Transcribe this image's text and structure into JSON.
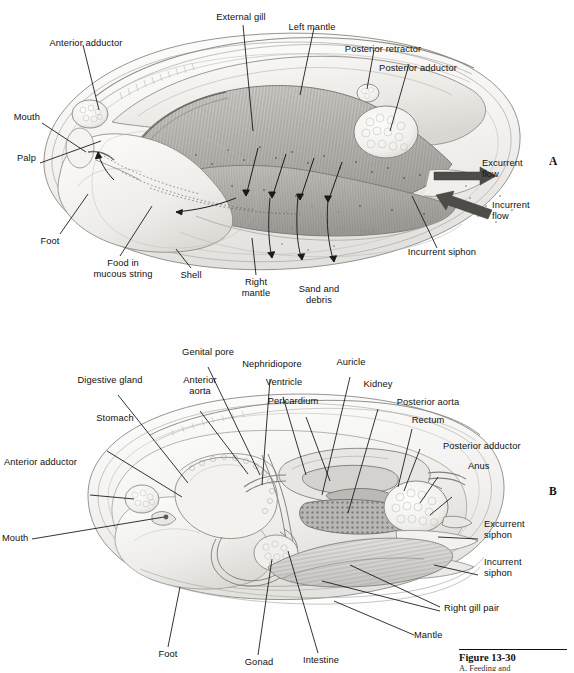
{
  "figure": {
    "caption_label": "Figure 13-30",
    "caption_sub": "A, Feeding and",
    "artist_signature": "Ober"
  },
  "panels": [
    {
      "id": "A",
      "name": "panel-a",
      "id_label": "A",
      "labels": [
        {
          "name": "external-gill",
          "text": "External gill"
        },
        {
          "name": "left-mantle",
          "text": "Left mantle"
        },
        {
          "name": "posterior-retractor",
          "text": "Posterior retractor"
        },
        {
          "name": "posterior-adductor",
          "text": "Posterior adductor"
        },
        {
          "name": "anterior-adductor",
          "text": "Anterior adductor"
        },
        {
          "name": "mouth",
          "text": "Mouth"
        },
        {
          "name": "palp",
          "text": "Palp"
        },
        {
          "name": "foot",
          "text": "Foot"
        },
        {
          "name": "food-in-mucous-string",
          "text": "Food in\nmucous string"
        },
        {
          "name": "shell",
          "text": "Shell"
        },
        {
          "name": "right-mantle",
          "text": "Right\nmantle"
        },
        {
          "name": "sand-and-debris",
          "text": "Sand and\ndebris"
        },
        {
          "name": "incurrent-siphon",
          "text": "Incurrent siphon"
        },
        {
          "name": "excurrent-flow",
          "text": "Excurrent\nflow"
        },
        {
          "name": "incurrent-flow",
          "text": "Incurrent\nflow"
        }
      ]
    },
    {
      "id": "B",
      "name": "panel-b",
      "id_label": "B",
      "labels": [
        {
          "name": "genital-pore",
          "text": "Genital pore"
        },
        {
          "name": "nephridiopore",
          "text": "Nephridiopore"
        },
        {
          "name": "auricle",
          "text": "Auricle"
        },
        {
          "name": "digestive-gland",
          "text": "Digestive gland"
        },
        {
          "name": "anterior-aorta",
          "text": "Anterior\naorta"
        },
        {
          "name": "ventricle",
          "text": "Ventricle"
        },
        {
          "name": "kidney",
          "text": "Kidney"
        },
        {
          "name": "pericardium",
          "text": "Pericardium"
        },
        {
          "name": "posterior-aorta",
          "text": "Posterior aorta"
        },
        {
          "name": "rectum",
          "text": "Rectum"
        },
        {
          "name": "stomach",
          "text": "Stomach"
        },
        {
          "name": "posterior-adductor",
          "text": "Posterior adductor"
        },
        {
          "name": "anterior-adductor",
          "text": "Anterior adductor"
        },
        {
          "name": "anus",
          "text": "Anus"
        },
        {
          "name": "excurrent-siphon",
          "text": "Excurrent\nsiphon"
        },
        {
          "name": "mouth",
          "text": "Mouth"
        },
        {
          "name": "incurrent-siphon",
          "text": "Incurrent\nsiphon"
        },
        {
          "name": "right-gill-pair",
          "text": "Right gill pair"
        },
        {
          "name": "mantle",
          "text": "Mantle"
        },
        {
          "name": "foot",
          "text": "Foot"
        },
        {
          "name": "gonad",
          "text": "Gonad"
        },
        {
          "name": "intestine",
          "text": "Intestine"
        }
      ]
    }
  ],
  "subject": {
    "organism": "freshwater clam",
    "view_a": "left valve and mantle removed, feeding and water currents",
    "view_b": "internal organs, left gill pair removed"
  }
}
